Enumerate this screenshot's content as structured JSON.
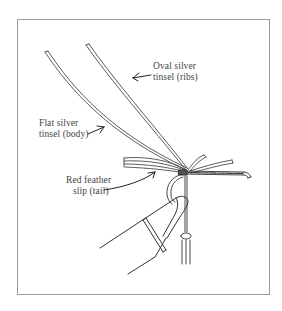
{
  "diagram": {
    "labels": [
      {
        "id": "oval-silver-tinsel",
        "line1": "Oval silver",
        "line2": "tinsel (ribs)"
      },
      {
        "id": "flat-silver-tinsel",
        "line1": "Flat silver",
        "line2": "tinsel (body)"
      },
      {
        "id": "red-feather-slip",
        "line1": "Red feather",
        "line2": "slip (tail)"
      }
    ],
    "colors": {
      "line": "#333333",
      "text": "#444444",
      "frame": "#9a9a9a",
      "background": "#ffffff"
    }
  }
}
